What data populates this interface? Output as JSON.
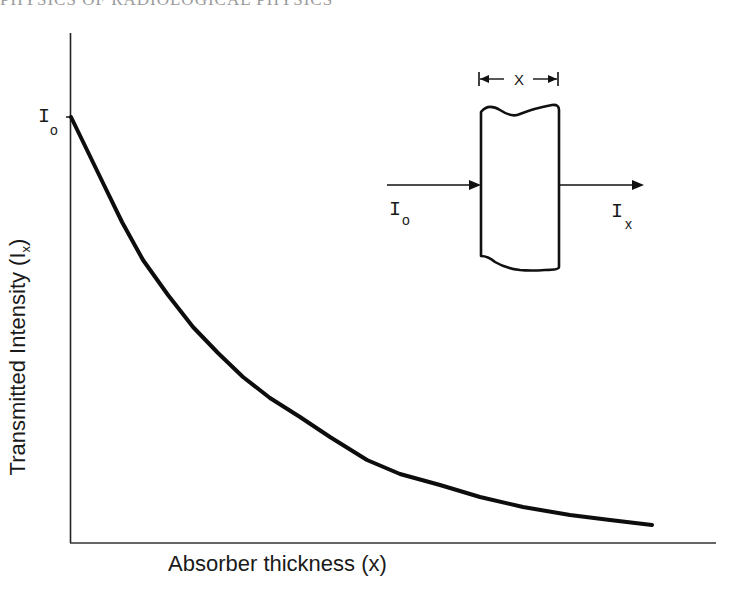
{
  "page": {
    "running_header": "PHYSICS OF RADIOLOGICAL PHYSICS"
  },
  "chart_data": {
    "type": "line",
    "title": "",
    "xlabel": "Absorber thickness (x)",
    "ylabel": "Transmitted Intensity (I",
    "ylabel_subscript": "x",
    "ylabel_close": ")",
    "y_tick_labels": [
      {
        "label": "I",
        "subscript": "o",
        "position": "top of curve at x=0"
      }
    ],
    "grid": false,
    "legend": null,
    "series": [
      {
        "name": "Transmitted intensity",
        "points_px": [
          [
            71,
            117
          ],
          [
            87,
            150
          ],
          [
            103,
            183
          ],
          [
            122,
            222
          ],
          [
            143,
            260
          ],
          [
            168,
            295
          ],
          [
            193,
            327
          ],
          [
            218,
            353
          ],
          [
            243,
            377
          ],
          [
            270,
            398
          ],
          [
            300,
            417
          ],
          [
            330,
            437
          ],
          [
            367,
            460
          ],
          [
            400,
            474
          ],
          [
            440,
            485
          ],
          [
            480,
            497
          ],
          [
            523,
            507
          ],
          [
            570,
            515
          ],
          [
            610,
            520
          ],
          [
            652,
            525
          ]
        ]
      }
    ],
    "relative_values": {
      "x": [
        0,
        0.1,
        0.2,
        0.3,
        0.4,
        0.5,
        0.6,
        0.7,
        0.8,
        0.9,
        1.0
      ],
      "y": [
        1.0,
        0.72,
        0.52,
        0.38,
        0.28,
        0.2,
        0.15,
        0.11,
        0.08,
        0.06,
        0.04
      ]
    }
  },
  "inset": {
    "dimension_label": "X",
    "incident_label": "I",
    "incident_subscript": "o",
    "transmitted_label": "I",
    "transmitted_subscript": "x"
  },
  "axis_labels": {
    "y_origin_label": "I",
    "y_origin_subscript": "o"
  },
  "colors": {
    "ink": "#111111",
    "background": "#ffffff"
  }
}
